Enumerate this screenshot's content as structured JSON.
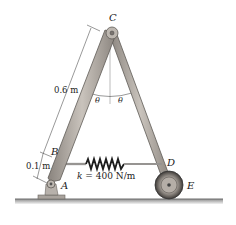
{
  "diagram": {
    "type": "statics-frame",
    "points": {
      "A": {
        "label": "A"
      },
      "B": {
        "label": "B"
      },
      "C": {
        "label": "C"
      },
      "D": {
        "label": "D"
      },
      "E": {
        "label": "E"
      }
    },
    "dimensions": {
      "upper_length": "0.6 m",
      "lower_length": "0.1 m"
    },
    "angles": {
      "left": "θ",
      "right": "θ"
    },
    "spring": {
      "label": "k = 400 N/m",
      "k_symbol": "k",
      "equals": "=",
      "value": "400 N/m"
    },
    "colors": {
      "member_fill": "#b3aca5",
      "member_edge": "#5e5a56",
      "ground": "#9a9a9a",
      "text": "#1a1a1a"
    }
  }
}
